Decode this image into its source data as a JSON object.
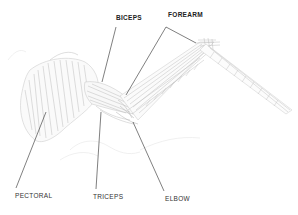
{
  "diagram": {
    "colors": {
      "background": "#ffffff",
      "label_text": "#222222",
      "leader_line": "#2a2a2a",
      "drawing_stroke": "#b8b8b8",
      "drawing_shade": "#d6d6d6"
    },
    "labels": [
      {
        "id": "biceps",
        "text": "BICEPS",
        "x": 116,
        "y": 15
      },
      {
        "id": "forearm",
        "text": "FOREARM",
        "x": 168,
        "y": 12
      },
      {
        "id": "pectoral",
        "text": "PECTORAL",
        "x": 15,
        "y": 193
      },
      {
        "id": "triceps",
        "text": "TRICEPS",
        "x": 93,
        "y": 194
      },
      {
        "id": "elbow",
        "text": "ELBOW",
        "x": 165,
        "y": 196
      }
    ]
  }
}
